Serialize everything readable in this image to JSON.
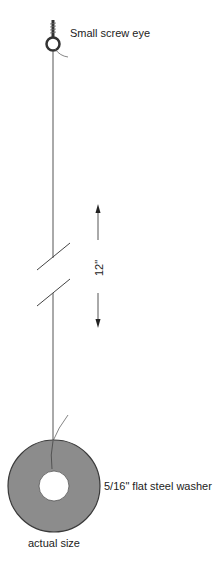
{
  "labels": {
    "screw_eye": "Small screw eye",
    "washer": "5/16\" flat steel washer",
    "actual_size": "actual size",
    "dimension": "12\""
  },
  "colors": {
    "washer_fill": "#8c8c8c",
    "washer_edge": "#3a3a3a",
    "line": "#555555",
    "text": "#222222"
  },
  "diagram": {
    "string_length_label": "12\"",
    "break_marks": 2,
    "arrows": [
      "up",
      "down"
    ]
  }
}
